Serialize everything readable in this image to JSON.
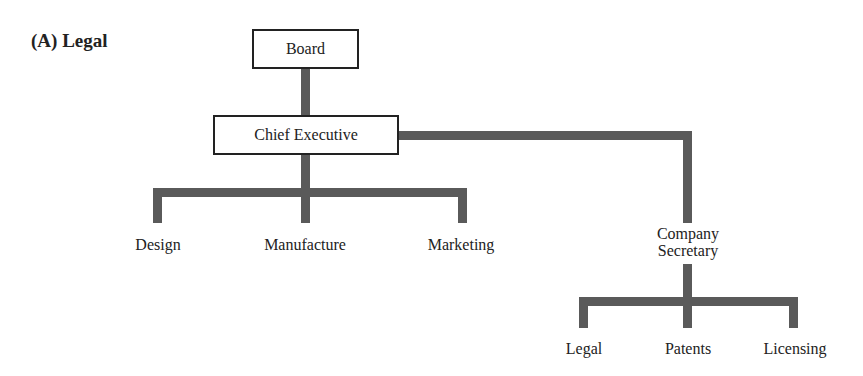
{
  "title": "(A)  Legal",
  "diagram": {
    "board": "Board",
    "chief_executive": "Chief Executive",
    "departments": [
      "Design",
      "Manufacture",
      "Marketing"
    ],
    "company_secretary": [
      "Company",
      "Secretary"
    ],
    "secretary_units": [
      "Legal",
      "Patents",
      "Licensing"
    ],
    "line_color": "#5a5a5a"
  }
}
